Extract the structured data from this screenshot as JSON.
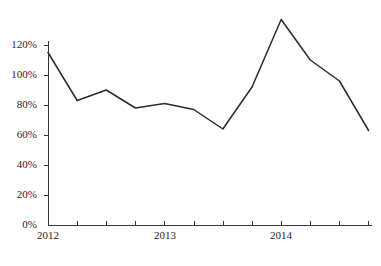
{
  "chart_data": {
    "type": "line",
    "title": "",
    "subtitle": "",
    "xlabel": "",
    "ylabel": "",
    "categories": [
      "2012 Q1",
      "2012 Q2",
      "2012 Q3",
      "2012 Q4",
      "2013 Q1",
      "2013 Q2",
      "2013 Q3",
      "2013 Q4",
      "2014 Q1",
      "2014 Q2",
      "2014 Q3",
      "2014 Q4"
    ],
    "values": [
      115,
      83,
      90,
      78,
      81,
      77,
      64,
      92,
      137,
      110,
      96,
      63
    ],
    "value_unit": "%",
    "ylim": [
      0,
      140
    ],
    "y_axis_max_tick": 120,
    "y_tick_step": 20,
    "ytick_labels": [
      "0%",
      "20%",
      "40%",
      "60%",
      "80%",
      "100%",
      "120%"
    ],
    "ytick_values": [
      0,
      20,
      40,
      60,
      80,
      100,
      120
    ],
    "xtick_labels": [
      "2012",
      "2013",
      "2014"
    ],
    "xtick_label_indices": [
      0,
      4,
      8
    ],
    "xtick_count": 12,
    "grid": false,
    "legend": false,
    "legend_position": "none",
    "series": [
      {
        "name": "series-1",
        "color": "#2e2a28",
        "values": [
          115,
          83,
          90,
          78,
          81,
          77,
          64,
          92,
          137,
          110,
          96,
          63
        ]
      }
    ],
    "annotations": []
  },
  "figure": {
    "caption": "",
    "background_color": "#ffffff",
    "axis_color": "#3a3533",
    "line_color": "#2e2a28",
    "text_color": "#2b2724"
  }
}
